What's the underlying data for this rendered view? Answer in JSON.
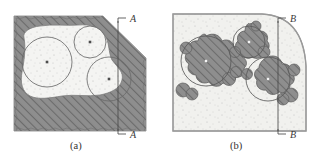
{
  "figure": {
    "kind": "engineering-section-diagram",
    "background": "#ffffff",
    "panels": [
      {
        "id": "a",
        "caption": "(a)",
        "caption_x": 76,
        "caption_y": 146,
        "section_label": "A",
        "section_label_top": "A",
        "section_label_bottom": "A",
        "section_line_x": 118,
        "section_line_top_y": 21,
        "section_line_bottom_y": 131,
        "matrix_fill": "#8c8c8c",
        "matrix_hatch": "#6f6f6f",
        "inclusion_fill": "#f4f4f2",
        "stipple": "#b9b9b9",
        "outline": "#8f8f8f",
        "circle_stroke": "#6a6a6a",
        "center_dot": "#4a4a4a",
        "circles": [
          {
            "cx": 47,
            "cy": 62,
            "r": 25
          },
          {
            "cx": 90,
            "cy": 42,
            "r": 16
          },
          {
            "cx": 109,
            "cy": 79,
            "r": 22
          }
        ]
      },
      {
        "id": "b",
        "caption": "(b)",
        "caption_x": 236,
        "caption_y": 146,
        "section_label": "B",
        "section_label_top": "B",
        "section_label_bottom": "B",
        "section_line_x": 278,
        "section_line_top_y": 21,
        "section_line_bottom_y": 131,
        "matrix_fill": "#f1f1ee",
        "blob_fill": "#8c8c8c",
        "blob_hatch": "#6f6f6f",
        "stipple": "#b5b5b5",
        "outline": "#9a9a9a",
        "circle_stroke": "#6a6a6a",
        "center_dot": "#f2f2f2",
        "circles": [
          {
            "cx": 206,
            "cy": 61,
            "r": 25
          },
          {
            "cx": 249,
            "cy": 42,
            "r": 16
          },
          {
            "cx": 268,
            "cy": 79,
            "r": 22
          }
        ]
      }
    ]
  },
  "icons": {
    "section_tick": "section-arrow-tick",
    "center_mark": "circle-center-mark"
  }
}
